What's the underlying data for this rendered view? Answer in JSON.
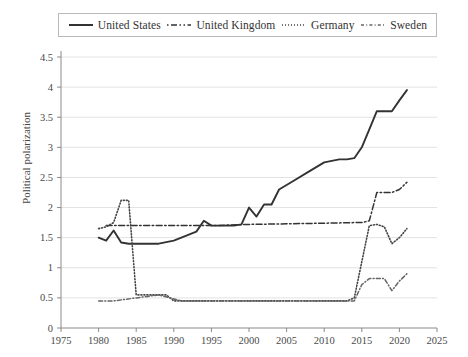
{
  "chart_data": {
    "type": "line",
    "title": "",
    "xlabel": "",
    "ylabel": "Political polarization",
    "xlim": [
      1975,
      2025
    ],
    "ylim": [
      0,
      4.5
    ],
    "xticks": [
      1975,
      1980,
      1985,
      1990,
      1995,
      2000,
      2005,
      2010,
      2015,
      2020,
      2025
    ],
    "yticks": [
      0,
      0.5,
      1,
      1.5,
      2,
      2.5,
      3,
      3.5,
      4,
      4.5
    ],
    "grid": "horizontal",
    "legend_position": "top",
    "series": [
      {
        "name": "United States",
        "style": "solid",
        "color": "#333333",
        "x": [
          1980,
          1981,
          1982,
          1983,
          1984,
          1986,
          1988,
          1990,
          1992,
          1993,
          1994,
          1995,
          1996,
          1997,
          1998,
          1999,
          2000,
          2001,
          2002,
          2003,
          2004,
          2006,
          2008,
          2010,
          2012,
          2013,
          2014,
          2015,
          2016,
          2017,
          2018,
          2019,
          2020,
          2021
        ],
        "values": [
          1.5,
          1.45,
          1.62,
          1.42,
          1.4,
          1.4,
          1.4,
          1.45,
          1.55,
          1.6,
          1.78,
          1.7,
          1.7,
          1.7,
          1.7,
          1.72,
          2.0,
          1.85,
          2.05,
          2.05,
          2.3,
          2.45,
          2.6,
          2.75,
          2.8,
          2.8,
          2.82,
          3.0,
          3.3,
          3.6,
          3.6,
          3.6,
          3.78,
          3.95
        ]
      },
      {
        "name": "United Kingdom",
        "style": "dashdot",
        "color": "#333333",
        "x": [
          1981,
          1982,
          1983,
          1984,
          1990,
          1995,
          2000,
          2005,
          2010,
          2014,
          2015,
          2016,
          2017,
          2018,
          2019,
          2020,
          2021
        ],
        "values": [
          1.7,
          1.7,
          1.7,
          1.7,
          1.7,
          1.7,
          1.72,
          1.73,
          1.74,
          1.75,
          1.75,
          1.78,
          2.25,
          2.25,
          2.25,
          2.3,
          2.42
        ]
      },
      {
        "name": "Germany",
        "style": "dotted",
        "color": "#444444",
        "x": [
          1980,
          1981,
          1982,
          1983,
          1984,
          1985,
          1986,
          1987,
          1988,
          1989,
          1990,
          1994,
          1998,
          2002,
          2005,
          2009,
          2013,
          2014,
          2015,
          2016,
          2017,
          2018,
          2019,
          2020,
          2021
        ],
        "values": [
          1.65,
          1.68,
          1.75,
          2.12,
          2.12,
          0.55,
          0.55,
          0.55,
          0.55,
          0.55,
          0.45,
          0.45,
          0.45,
          0.45,
          0.45,
          0.45,
          0.45,
          0.5,
          1.1,
          1.7,
          1.72,
          1.68,
          1.4,
          1.5,
          1.65
        ]
      },
      {
        "name": "Sweden",
        "style": "dashdot-short",
        "color": "#666666",
        "x": [
          1980,
          1982,
          1985,
          1988,
          1991,
          1994,
          1998,
          2002,
          2006,
          2010,
          2014,
          2015,
          2016,
          2017,
          2018,
          2019,
          2020,
          2021
        ],
        "values": [
          0.45,
          0.45,
          0.5,
          0.55,
          0.45,
          0.45,
          0.45,
          0.45,
          0.45,
          0.45,
          0.45,
          0.72,
          0.82,
          0.82,
          0.82,
          0.62,
          0.78,
          0.9
        ]
      }
    ]
  },
  "legend": {
    "items": [
      {
        "label": "United States",
        "swatch": "solid-line-icon"
      },
      {
        "label": "United Kingdom",
        "swatch": "dashdot-line-icon"
      },
      {
        "label": "Germany",
        "swatch": "dotted-line-icon"
      },
      {
        "label": "Sweden",
        "swatch": "dashed-line-icon"
      }
    ]
  },
  "axes": {
    "y_title": "Political polarization",
    "y_labels": [
      "4.5",
      "4",
      "3.5",
      "3",
      "2.5",
      "2",
      "1.5",
      "1",
      "0.5",
      "0"
    ],
    "x_labels": [
      "1975",
      "1980",
      "1985",
      "1990",
      "1995",
      "2000",
      "2005",
      "2010",
      "2015",
      "2020",
      "2025"
    ]
  }
}
